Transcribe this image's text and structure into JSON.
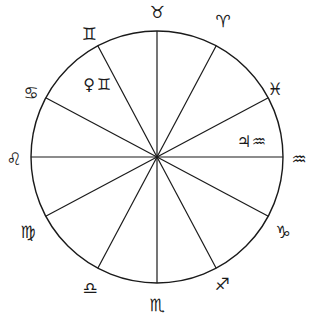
{
  "chart": {
    "type": "zodiac-wheel",
    "center": [
      157,
      157
    ],
    "radius": 126,
    "colors": {
      "line": "#1a1a1a",
      "background": "#ffffff"
    },
    "spoke_angles_deg": [
      0,
      28,
      62,
      90,
      118,
      152,
      180,
      208,
      242,
      270,
      298,
      332
    ]
  },
  "signs": [
    {
      "name": "Taurus",
      "glyph": "♉",
      "x": 157,
      "y": 12
    },
    {
      "name": "Aries",
      "glyph": "♈",
      "x": 223,
      "y": 21
    },
    {
      "name": "Pisces",
      "glyph": "♓",
      "x": 275,
      "y": 89
    },
    {
      "name": "Aquarius",
      "glyph": "♒",
      "x": 299,
      "y": 159
    },
    {
      "name": "Capricorn",
      "glyph": "♑",
      "x": 283,
      "y": 232
    },
    {
      "name": "Sagittarius",
      "glyph": "♐",
      "x": 222,
      "y": 284
    },
    {
      "name": "Scorpio",
      "glyph": "♏",
      "x": 157,
      "y": 305
    },
    {
      "name": "Libra",
      "glyph": "♎",
      "x": 90,
      "y": 288
    },
    {
      "name": "Virgo",
      "glyph": "♍",
      "x": 28,
      "y": 232
    },
    {
      "name": "Leo",
      "glyph": "♌",
      "x": 14,
      "y": 159
    },
    {
      "name": "Cancer",
      "glyph": "♋",
      "x": 31,
      "y": 93
    },
    {
      "name": "Gemini",
      "glyph": "♊",
      "x": 89,
      "y": 34
    }
  ],
  "placements": [
    {
      "planet": "Venus",
      "planet_glyph": "♀",
      "sign": "Gemini",
      "sign_glyph": "♊",
      "x": 89,
      "y": 84
    },
    {
      "planet": "Jupiter",
      "planet_glyph": "♃",
      "sign": "Aquarius",
      "sign_glyph": "♒",
      "x": 244,
      "y": 141
    }
  ]
}
